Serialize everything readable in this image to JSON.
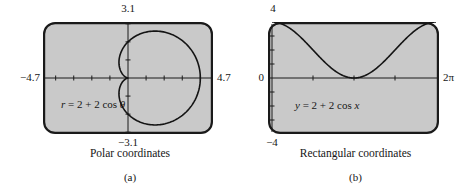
{
  "style": {
    "panel_fill": "#c9c9c9",
    "panel_stroke": "#1a1a1a",
    "axis_color": "#1a1a1a",
    "curve_color": "#141414",
    "text_color": "#161616"
  },
  "panels": [
    {
      "name": "polar",
      "labels": {
        "top": "3.1",
        "bottom": "−3.1",
        "left": "−4.7",
        "right": "4.7"
      },
      "equation": {
        "lhs": "r",
        "mid": " = 2 + 2 cos ",
        "rhs_var": "θ"
      },
      "caption": "Polar coordinates",
      "tag": "(a)"
    },
    {
      "name": "rectangular",
      "labels": {
        "top": "4",
        "bottom": "−4",
        "left": "0",
        "right_num": "2",
        "right_pi": "π"
      },
      "equation": {
        "lhs": "y",
        "mid": " = 2 + 2 cos ",
        "rhs_var": "x"
      },
      "caption": "Rectangular coordinates",
      "tag": "(b)"
    }
  ],
  "chart_data": [
    {
      "type": "line",
      "coordinate_system": "polar",
      "curve": "cardioid",
      "equation": "r = 2 + 2 cos θ",
      "params": {
        "a": 2,
        "b": 2
      },
      "theta_range": [
        0,
        6.283185307
      ],
      "window": {
        "xmin": -4.7,
        "xmax": 4.7,
        "ymin": -3.1,
        "ymax": 3.1
      },
      "tick_spacing": {
        "x": 1,
        "y": 1
      },
      "key_points_theta_r": [
        [
          0,
          4
        ],
        [
          1.5708,
          2
        ],
        [
          3.1416,
          0
        ],
        [
          4.7124,
          2
        ],
        [
          6.2832,
          4
        ]
      ],
      "axis_end_labels": {
        "top": "3.1",
        "bottom": "−3.1",
        "left": "−4.7",
        "right": "4.7"
      },
      "title": "Polar coordinates",
      "panel_label": "(a)",
      "grid": false,
      "legend": false
    },
    {
      "type": "line",
      "coordinate_system": "rectangular",
      "equation": "y = 2 + 2 cos x",
      "params": {
        "a": 2,
        "b": 2
      },
      "x_range": [
        0,
        6.283185307
      ],
      "window": {
        "xmin": 0,
        "xmax": 6.283185307,
        "ymin": -4,
        "ymax": 4
      },
      "x_ticks_at": [
        1.570796,
        3.141593,
        4.712389
      ],
      "y_tick_spacing": 1,
      "key_points_xy": [
        [
          0,
          4
        ],
        [
          1.5708,
          2
        ],
        [
          3.1416,
          0
        ],
        [
          4.7124,
          2
        ],
        [
          6.2832,
          4
        ]
      ],
      "axis_end_labels": {
        "top": "4",
        "bottom": "−4",
        "left": "0",
        "right": "2π"
      },
      "title": "Rectangular coordinates",
      "panel_label": "(b)",
      "grid": false,
      "legend": false
    }
  ]
}
